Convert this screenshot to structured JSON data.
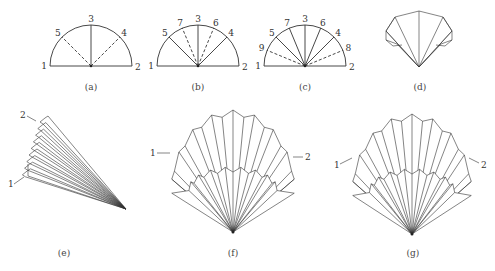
{
  "figure": {
    "panels": [
      {
        "id": "a",
        "caption": "(a)",
        "type": "semicircle",
        "center": [
          91,
          66
        ],
        "radius": 41,
        "points": [
          {
            "label": "1",
            "angle": 180,
            "style": "base"
          },
          {
            "label": "2",
            "angle": 0,
            "style": "base"
          },
          {
            "label": "3",
            "angle": 90,
            "style": "solid"
          },
          {
            "label": "5",
            "angle": 135,
            "style": "dashed"
          },
          {
            "label": "4",
            "angle": 45,
            "style": "dashed"
          }
        ]
      },
      {
        "id": "b",
        "caption": "(b)",
        "type": "semicircle",
        "center": [
          198,
          66
        ],
        "radius": 41,
        "points": [
          {
            "label": "1",
            "angle": 180,
            "style": "base"
          },
          {
            "label": "2",
            "angle": 0,
            "style": "base"
          },
          {
            "label": "3",
            "angle": 90,
            "style": "solid"
          },
          {
            "label": "5",
            "angle": 135,
            "style": "solid"
          },
          {
            "label": "4",
            "angle": 45,
            "style": "solid"
          },
          {
            "label": "7",
            "angle": 112.5,
            "style": "dashed"
          },
          {
            "label": "6",
            "angle": 67.5,
            "style": "dashed"
          }
        ]
      },
      {
        "id": "c",
        "caption": "(c)",
        "type": "semicircle",
        "center": [
          305,
          66
        ],
        "radius": 41,
        "points": [
          {
            "label": "1",
            "angle": 180,
            "style": "base"
          },
          {
            "label": "2",
            "angle": 0,
            "style": "base"
          },
          {
            "label": "3",
            "angle": 90,
            "style": "solid"
          },
          {
            "label": "5",
            "angle": 135,
            "style": "solid"
          },
          {
            "label": "4",
            "angle": 45,
            "style": "solid"
          },
          {
            "label": "7",
            "angle": 112.5,
            "style": "solid"
          },
          {
            "label": "6",
            "angle": 67.5,
            "style": "solid"
          },
          {
            "label": "9",
            "angle": 157.5,
            "style": "dashed"
          },
          {
            "label": "8",
            "angle": 22.5,
            "style": "dashed"
          }
        ]
      },
      {
        "id": "d",
        "caption": "(d)",
        "type": "folded-cone"
      },
      {
        "id": "e",
        "caption": "(e)",
        "type": "stacked-pleats",
        "markers": [
          {
            "label": "2"
          },
          {
            "label": "1"
          }
        ]
      },
      {
        "id": "f",
        "caption": "(f)",
        "type": "open-fan",
        "markers": [
          {
            "label": "1"
          },
          {
            "label": "2"
          }
        ]
      },
      {
        "id": "g",
        "caption": "(g)",
        "type": "open-fan",
        "markers": [
          {
            "label": "1"
          },
          {
            "label": "2"
          }
        ]
      }
    ]
  },
  "captions": {
    "a": "(a)",
    "b": "(b)",
    "c": "(c)",
    "d": "(d)",
    "e": "(e)",
    "f": "(f)",
    "g": "(g)"
  },
  "markers": {
    "e_top": "2",
    "e_bottom": "1",
    "f_left": "1",
    "f_right": "2",
    "g_left": "1",
    "g_right": "2"
  }
}
